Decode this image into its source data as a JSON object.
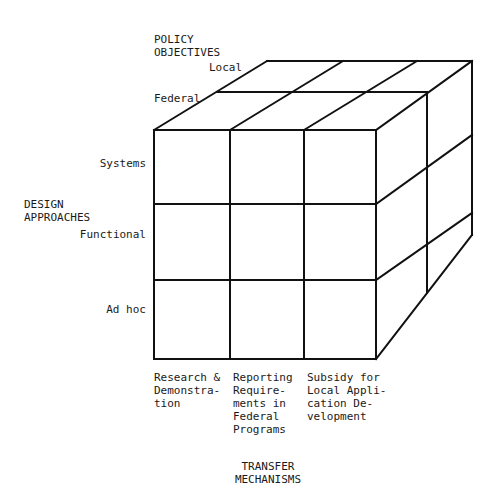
{
  "axes": {
    "policy_objectives": {
      "title_line1": "POLICY",
      "title_line2": "OBJECTIVES",
      "levels": [
        "Local",
        "Federal"
      ]
    },
    "design_approaches": {
      "title_line1": "DESIGN",
      "title_line2": "APPROACHES",
      "levels": [
        "Systems",
        "Functional",
        "Ad hoc"
      ]
    },
    "transfer_mechanisms": {
      "title_line1": "TRANSFER",
      "title_line2": "MECHANISMS",
      "levels": [
        {
          "lines": [
            "Research &",
            "Demonstra-",
            "tion"
          ]
        },
        {
          "lines": [
            "Reporting",
            "Require-",
            "ments in",
            "Federal",
            "Programs"
          ]
        },
        {
          "lines": [
            "Subsidy for",
            "Local Appli-",
            "cation De-",
            "velopment"
          ]
        }
      ]
    }
  },
  "colors": {
    "line": "#111111",
    "background": "#ffffff"
  }
}
